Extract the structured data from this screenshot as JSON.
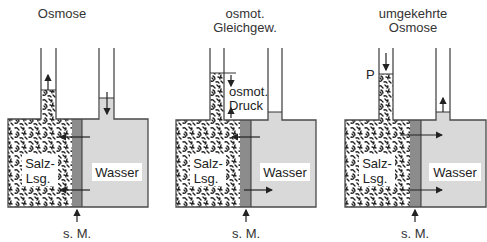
{
  "colors": {
    "outline": "#4a4a4a",
    "water": "#d9d9d9",
    "membrane": "#8c8c8c",
    "salt_bg": "#ffffff",
    "salt_speckle": "#222222",
    "text": "#333333"
  },
  "panels": [
    {
      "title_lines": [
        "Osmose"
      ],
      "salt_label": [
        "Salz-",
        "Lsg."
      ],
      "water_label": "Wasser",
      "membrane_label": "s. M.",
      "left_tube_arrow": "up",
      "right_tube_arrow": "down",
      "membrane_arrows": "right-to-left"
    },
    {
      "title_lines": [
        "osmot.",
        "Gleichgew."
      ],
      "salt_label": [
        "Salz-",
        "Lsg."
      ],
      "water_label": "Wasser",
      "membrane_label": "s. M.",
      "pressure_label": [
        "osmot.",
        "Druck"
      ],
      "membrane_arrows": "both"
    },
    {
      "title_lines": [
        "umgekehrte",
        "Osmose"
      ],
      "salt_label": [
        "Salz-",
        "Lsg."
      ],
      "water_label": "Wasser",
      "membrane_label": "s. M.",
      "pressure_symbol": "P",
      "left_tube_arrow": "down",
      "right_tube_arrow": "up",
      "membrane_arrows": "left-to-right"
    }
  ]
}
